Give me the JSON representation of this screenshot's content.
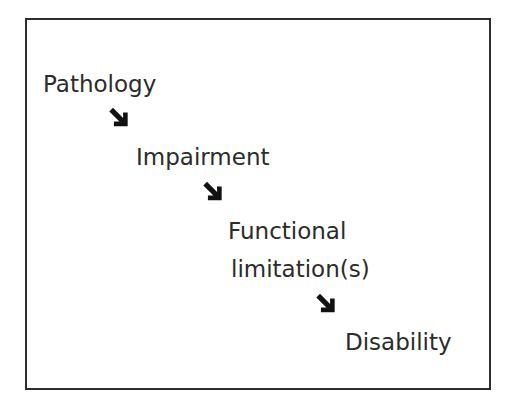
{
  "diagram": {
    "type": "flow",
    "direction": "diagonal-down-right",
    "border_color": "#2e2e2e",
    "text_color": "#2b2b2b",
    "arrow_icon": "down-right-arrow-icon",
    "nodes": [
      {
        "label": "Pathology"
      },
      {
        "label": "Impairment"
      },
      {
        "label": "Functional",
        "label_line2": "limitation(s)"
      },
      {
        "label": "Disability"
      }
    ],
    "edges": [
      {
        "from": "Pathology",
        "to": "Impairment"
      },
      {
        "from": "Impairment",
        "to": "Functional limitation(s)"
      },
      {
        "from": "Functional limitation(s)",
        "to": "Disability"
      }
    ]
  }
}
